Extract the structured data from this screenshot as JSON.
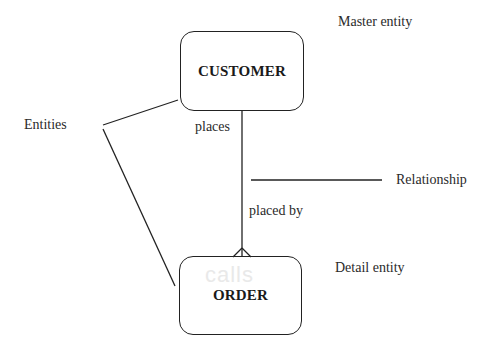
{
  "diagram": {
    "entities": [
      {
        "name": "CUSTOMER",
        "role": "Master entity"
      },
      {
        "name": "ORDER",
        "role": "Detail entity"
      }
    ],
    "relationship": {
      "forward_label": "places",
      "reverse_label": "placed by",
      "annotation": "Relationship",
      "cardinality_end": "crow-foot-at-ORDER"
    },
    "annotations": {
      "entities": "Entities",
      "master": "Master entity",
      "detail": "Detail entity",
      "relationship": "Relationship"
    },
    "watermark": "calls"
  }
}
